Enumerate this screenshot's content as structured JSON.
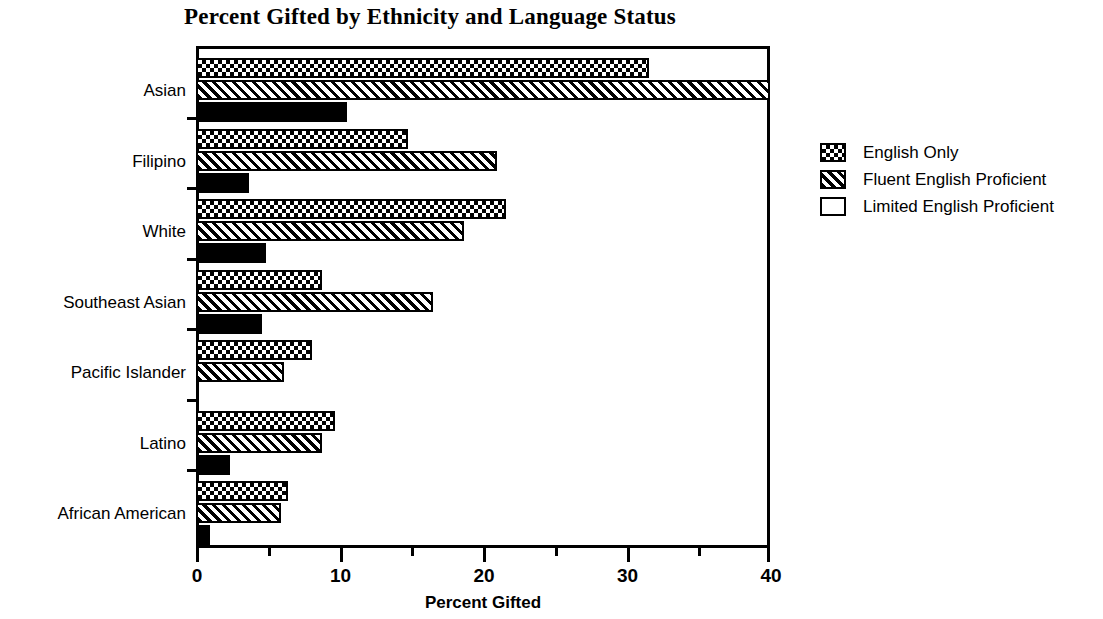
{
  "chart_data": {
    "type": "bar",
    "orientation": "horizontal",
    "title": "Percent Gifted by Ethnicity and Language Status",
    "xlabel": "Percent Gifted",
    "ylabel": "",
    "xlim": [
      0,
      40
    ],
    "xticks": [
      0,
      10,
      20,
      30,
      40
    ],
    "xticklabels": [
      "0",
      "10",
      "20",
      "30",
      "40"
    ],
    "xminorticks": [
      5,
      15,
      25,
      35
    ],
    "grid": false,
    "legend_position": "right",
    "categories": [
      "Asian",
      "Filipino",
      "White",
      "Southeast Asian",
      "Pacific Islander",
      "Latino",
      "African American"
    ],
    "series": [
      {
        "name": "English Only",
        "pattern": "checkerboard",
        "values": [
          31.6,
          14.8,
          21.6,
          8.8,
          8.1,
          9.7,
          6.4
        ]
      },
      {
        "name": "Fluent English Proficient",
        "pattern": "diagonal-hatch",
        "values": [
          40.0,
          21.0,
          18.7,
          16.5,
          6.1,
          8.8,
          5.9
        ]
      },
      {
        "name": "Limited English Proficient",
        "pattern": "solid-black",
        "values": [
          10.5,
          3.7,
          4.9,
          4.6,
          0.0,
          2.4,
          1.0
        ]
      }
    ]
  },
  "colors": {
    "foreground": "#000000",
    "background": "#ffffff"
  }
}
